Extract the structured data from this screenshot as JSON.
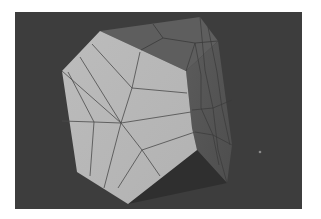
{
  "scene": {
    "title": "3D polyhedron mesh render",
    "background_color": "#3d3d3d",
    "page_color": "#ffffff",
    "viewport": {
      "x": 15,
      "y": 12,
      "width": 287,
      "height": 197
    },
    "object": {
      "type": "low-poly polyhedron",
      "faces": {
        "front": {
          "color": "#b8b8b8",
          "points": "100,31 141,50 186,71 192,128 197,150 128,204 77,172 62,71"
        },
        "top": {
          "color": "#5e5e5e",
          "points": "100,31 200,17 218,41 186,71 141,50"
        },
        "right": {
          "color": "#575757",
          "points": "200,17 218,41 232,145 227,183 197,150 192,128 186,71 218,41"
        },
        "bottom": {
          "color": "#2f2f2f",
          "points": "197,150 227,183 128,204"
        }
      },
      "edge_color": "#3a3a3a",
      "front_edges": [
        "62,71 121,123",
        "80,57 121,123",
        "92,44 132,88 121,123",
        "140,52 132,88",
        "132,88 187,93",
        "121,123 191,112",
        "121,123 142,150 195,132",
        "142,150 160,176",
        "142,150 118,188",
        "121,123 104,188",
        "121,123 94,122 90,176",
        "62,121 94,122",
        "68,72 94,122"
      ],
      "top_edges": [
        "153,24 163,38 141,50",
        "163,38 195,43 218,41"
      ],
      "right_edges": [
        "195,43 186,71",
        "200,17 205,70 213,108 218,150 227,183",
        "208,27 217,72 222,108 230,145",
        "195,43 201,75 201,108 213,135 219,165",
        "192,110 213,108 232,100",
        "195,132 213,135 232,145"
      ]
    },
    "marker": {
      "x": 260,
      "y": 152,
      "color": "#8a8a8a"
    }
  }
}
